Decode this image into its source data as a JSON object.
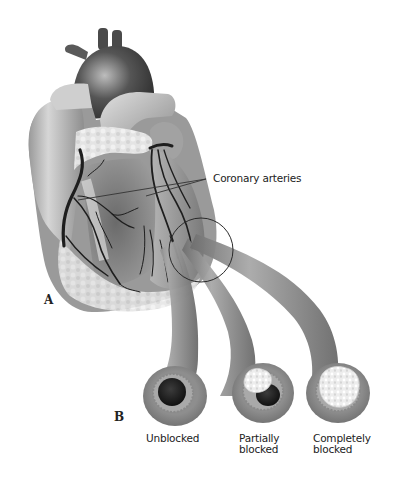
{
  "figure": {
    "panels": [
      {
        "letter": "A",
        "subject": "heart-anterior-view"
      },
      {
        "letter": "B",
        "subject": "artery-cross-sections"
      }
    ],
    "callout": {
      "label": "Coronary arteries"
    },
    "cross_sections": [
      {
        "label_line1": "Unblocked",
        "label_line2": "",
        "state": "unblocked"
      },
      {
        "label_line1": "Partially",
        "label_line2": "blocked",
        "state": "partially-blocked"
      },
      {
        "label_line1": "Completely",
        "label_line2": "blocked",
        "state": "completely-blocked"
      }
    ],
    "colors": {
      "background": "#ffffff",
      "heart_dark": "#3a3a3a",
      "heart_mid": "#8a8a8a",
      "heart_light": "#c8c8c8",
      "fat": "#e6e6e6",
      "artery_wall": "#8c8c8c",
      "artery_inner": "#b0b0b0",
      "lumen": "#1e1e1e",
      "plaque": "#f2f2f2",
      "line": "#333333"
    }
  }
}
